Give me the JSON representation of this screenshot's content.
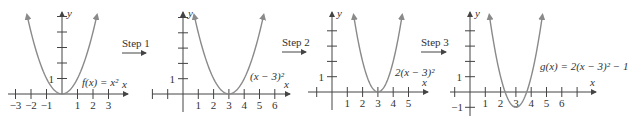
{
  "colors": {
    "curve": "#8a8a8a",
    "axis": "#444444",
    "text": "#333333"
  },
  "steps": [
    {
      "label": "Step 1"
    },
    {
      "label": "Step 2"
    },
    {
      "label": "Step 3"
    }
  ],
  "panels": [
    {
      "name": "parent",
      "function_label": "f(x) = x²",
      "a": 1,
      "h": 0,
      "k": 0,
      "x_ticks": [
        "−3",
        "−2",
        "−1",
        "1",
        "2",
        "3"
      ],
      "x_tick_values": [
        -3,
        -2,
        -1,
        1,
        2,
        3
      ],
      "y_tick_label": "1",
      "axis_x_label": "x",
      "axis_y_label": "y"
    },
    {
      "name": "shift-right",
      "function_label": "(x − 3)²",
      "a": 1,
      "h": 3,
      "k": 0,
      "x_ticks": [
        "1",
        "2",
        "3",
        "4",
        "5",
        "6"
      ],
      "x_tick_values": [
        1,
        2,
        3,
        4,
        5,
        6
      ],
      "y_tick_label": "1",
      "axis_x_label": "x",
      "axis_y_label": "y"
    },
    {
      "name": "vertical-stretch",
      "function_label": "2(x − 3)²",
      "a": 2,
      "h": 3,
      "k": 0,
      "x_ticks": [
        "1",
        "2",
        "3",
        "4",
        "5"
      ],
      "x_tick_values": [
        1,
        2,
        3,
        4,
        5
      ],
      "y_tick_label": "1",
      "axis_x_label": "x",
      "axis_y_label": "y"
    },
    {
      "name": "shift-down",
      "function_label": "g(x) = 2(x − 3)² − 1",
      "a": 2,
      "h": 3,
      "k": -1,
      "x_ticks": [
        "1",
        "2",
        "3",
        "4",
        "5",
        "6"
      ],
      "x_tick_values": [
        1,
        2,
        3,
        4,
        5,
        6
      ],
      "y_tick_label": "1",
      "y_tick_neg_label": "−1",
      "axis_x_label": "x",
      "axis_y_label": "y"
    }
  ]
}
